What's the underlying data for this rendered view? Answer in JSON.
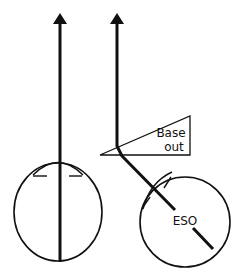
{
  "diagram": {
    "colors": {
      "stroke": "#111111",
      "background": "#ffffff"
    },
    "labels": {
      "prism_line1": "Base",
      "prism_line2": "out",
      "eye_deviation": "ESO"
    },
    "elements": {
      "left_eye": {
        "shape": "circle",
        "name": "left-eye"
      },
      "right_eye": {
        "shape": "circle",
        "name": "right-eye-esotropic"
      },
      "left_sightline": {
        "shape": "arrow",
        "direction": "up"
      },
      "right_sightline": {
        "shape": "bent-arrow",
        "direction": "up"
      },
      "prism": {
        "shape": "triangle",
        "orientation": "base out"
      }
    }
  }
}
